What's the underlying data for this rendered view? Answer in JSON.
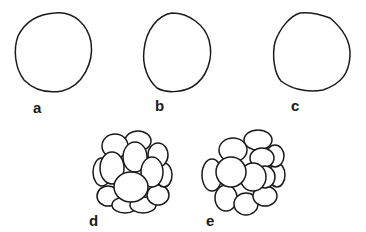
{
  "figure": {
    "panels": [
      {
        "id": "a",
        "label": "a",
        "shape": "single-cell"
      },
      {
        "id": "b",
        "label": "b",
        "shape": "single-cell"
      },
      {
        "id": "c",
        "label": "c",
        "shape": "single-cell"
      },
      {
        "id": "d",
        "label": "d",
        "shape": "cell-cluster"
      },
      {
        "id": "e",
        "label": "e",
        "shape": "cell-cluster"
      }
    ],
    "colors": {
      "line": "#1a1a1a",
      "background": "#ffffff"
    }
  }
}
